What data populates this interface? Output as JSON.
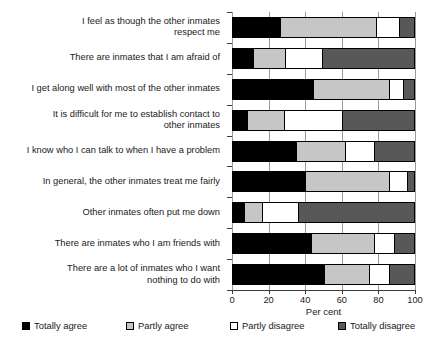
{
  "chart_data": {
    "type": "bar",
    "orientation": "horizontal",
    "stacked": true,
    "stack_total": 100,
    "title": "",
    "xlabel": "Per cent",
    "ylabel": "",
    "xlim": [
      0,
      100
    ],
    "xticks": [
      0,
      20,
      40,
      60,
      80,
      100
    ],
    "grid": "vertical",
    "legend_position": "bottom",
    "categories": [
      "I feel as though the other inmates\nrespect me",
      "There are inmates that I am afraid of",
      "I get along well with most of the other inmates",
      "It is difficult for me to establish contact to\nother inmates",
      "I know who I can talk to when I have a problem",
      "In general, the other inmates treat me fairly",
      "Other inmates often put me down",
      "There are inmates who I am friends with",
      "There are a lot of inmates who I want\nnothing to do with"
    ],
    "series": [
      {
        "name": "Totally agree",
        "color": "#000000",
        "values": [
          26,
          11,
          44,
          8,
          35,
          40,
          6,
          43,
          50
        ]
      },
      {
        "name": "Partly agree",
        "color": "#c6c6c6",
        "values": [
          53,
          18,
          42,
          20,
          27,
          46,
          10,
          35,
          25
        ]
      },
      {
        "name": "Partly disagree",
        "color": "#ffffff",
        "values": [
          13,
          20,
          8,
          32,
          16,
          10,
          20,
          11,
          11
        ]
      },
      {
        "name": "Totally disagree",
        "color": "#585858",
        "values": [
          8,
          51,
          6,
          40,
          22,
          4,
          64,
          11,
          14
        ]
      }
    ]
  }
}
